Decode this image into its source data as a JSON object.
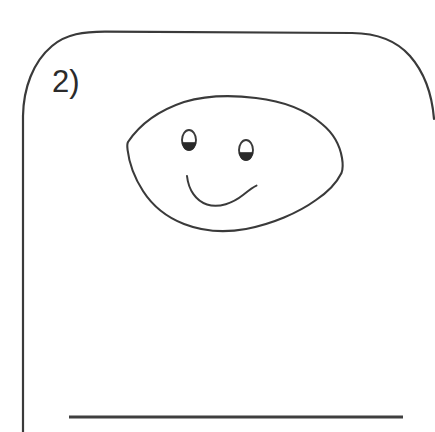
{
  "page": {
    "width": 435,
    "height": 432,
    "background_color": "#ffffff",
    "ink_color": "#3a3a3a"
  },
  "question": {
    "number_label": "2)"
  },
  "worksheet_frame": {
    "name": "rounded-answer-box",
    "top_border_y": 32,
    "left_border_x": 23,
    "corner_radius": 58,
    "stroke_width": 2.2,
    "stroke_color": "#3a3a3a"
  },
  "answer_line": {
    "name": "answer-writing-line",
    "x_start": 69,
    "x_end": 403,
    "y": 417,
    "stroke_width": 3,
    "stroke_color": "#3f3f3f"
  },
  "drawing": {
    "name": "hand-drawn-smiley-face",
    "shape": "leaf-oval",
    "stroke_color": "#3a3a3a",
    "stroke_width": 2.1,
    "outline_bounds": {
      "left": 127,
      "right": 343,
      "top": 96,
      "bottom": 231
    },
    "left_point": {
      "x": 127,
      "y": 143
    },
    "right_point": {
      "x": 343,
      "y": 172
    },
    "eyes": [
      {
        "name": "left-eye",
        "cx": 189,
        "cy": 140,
        "rx": 7,
        "ry": 10
      },
      {
        "name": "right-eye",
        "cx": 246,
        "cy": 150,
        "rx": 7,
        "ry": 10
      }
    ],
    "pupil_color": "#2a2a2a",
    "mouth": {
      "name": "smile-curve",
      "start": {
        "x": 187,
        "y": 176
      },
      "low_point": {
        "x": 216,
        "y": 205
      },
      "end": {
        "x": 256,
        "y": 186
      }
    }
  }
}
